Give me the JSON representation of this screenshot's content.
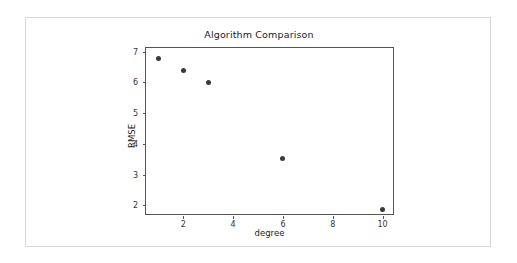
{
  "chart_data": {
    "type": "scatter",
    "title": "Algorithm Comparison",
    "xlabel": "degree",
    "ylabel": "RMSE",
    "x": [
      1,
      2,
      3,
      6,
      10
    ],
    "values": [
      6.78,
      6.4,
      6.0,
      3.52,
      1.87
    ],
    "series": [
      {
        "name": "RMSE",
        "x": [
          1,
          2,
          3,
          6,
          10
        ],
        "values": [
          6.78,
          6.4,
          6.0,
          3.52,
          1.87
        ],
        "marker": "circle",
        "color": "#3a3a3a"
      }
    ],
    "xticks": [
      2,
      4,
      6,
      8,
      10
    ],
    "yticks": [
      2,
      3,
      4,
      5,
      6,
      7
    ],
    "xlim": [
      0.5,
      10.5
    ],
    "ylim": [
      1.65,
      7.12
    ],
    "grid": false,
    "legend": false,
    "frame_color": "#555555",
    "background": "#ffffff"
  }
}
